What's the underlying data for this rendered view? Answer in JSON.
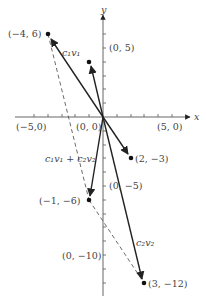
{
  "diagram": {
    "axes": {
      "x_label": "x",
      "y_label": "y"
    },
    "axis_labels": {
      "neg5": "(−5,0)",
      "origin": "(0, 0)",
      "pos5x": "(5, 0)",
      "pos5y": "(0, 5)",
      "neg5y": "(0, −5)",
      "neg10y": "(0, −10)"
    },
    "points": {
      "p1": "(−4, 6)",
      "p2": "(2, −3)",
      "p3": "(−1, −6)",
      "p4": "(3, −12)"
    },
    "vector_labels": {
      "c1v1": "c₁v₁",
      "c2v2": "c₂v₂",
      "sum": "c₁v₁ + c₂v₂"
    },
    "colors": {
      "line": "#222222",
      "axis": "#555555",
      "label": "#444444"
    }
  }
}
